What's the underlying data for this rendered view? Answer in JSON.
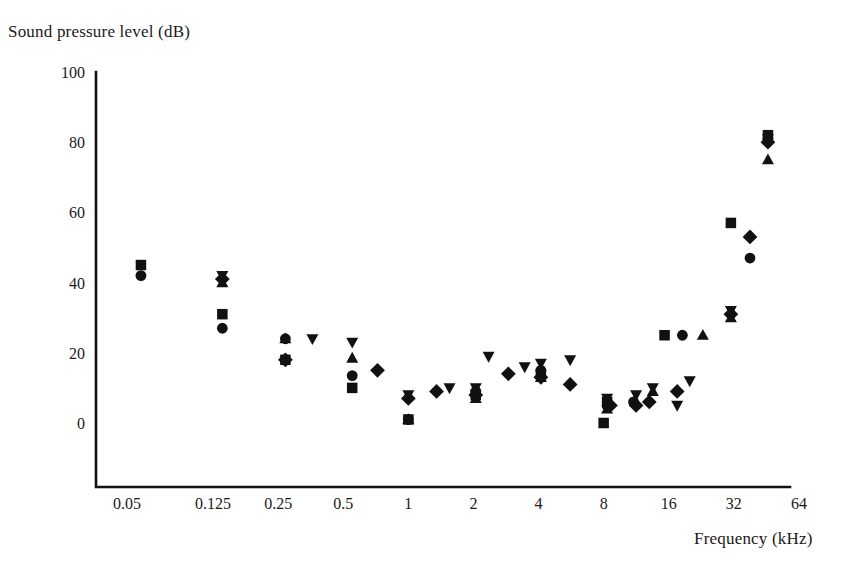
{
  "figure": {
    "width": 858,
    "height": 581,
    "background": "#ffffff",
    "ink_color": "#111111"
  },
  "axis_titles": {
    "y": "Sound pressure level (dB)",
    "x": "Frequency (kHz)"
  },
  "chart_data": {
    "type": "scatter",
    "title": "",
    "subtitle": "",
    "xlabel": "Frequency (kHz)",
    "ylabel": "Sound pressure level (dB)",
    "xscale": "log2",
    "yscale": "linear",
    "xlim": [
      0.0405,
      80
    ],
    "ylim": [
      -8,
      100
    ],
    "ylim_axis": [
      0,
      100
    ],
    "grid": false,
    "legend": "none",
    "legend_entries": [],
    "annotations": [],
    "xticks": [
      0.05,
      0.125,
      0.25,
      0.5,
      1,
      2,
      4,
      8,
      16,
      32,
      64
    ],
    "xtick_labels": [
      "0.05",
      "0.125",
      "0.25",
      "0.5",
      "1",
      "2",
      "4",
      "8",
      "16",
      "32",
      "64"
    ],
    "yticks": [
      0,
      20,
      40,
      60,
      80,
      100
    ],
    "ytick_labels": [
      "0",
      "20",
      "40",
      "60",
      "80",
      "100"
    ],
    "marker_shapes": [
      "square",
      "circle",
      "diamond",
      "triangle-up",
      "triangle-down"
    ],
    "series": [
      {
        "name": "series-square",
        "marker": "square",
        "points": [
          {
            "x": 0.058,
            "y": 45
          },
          {
            "x": 0.138,
            "y": 31
          },
          {
            "x": 0.27,
            "y": 18
          },
          {
            "x": 0.55,
            "y": 10
          },
          {
            "x": 1.0,
            "y": 1
          },
          {
            "x": 2.05,
            "y": 8
          },
          {
            "x": 4.1,
            "y": 14
          },
          {
            "x": 8.0,
            "y": 0
          },
          {
            "x": 8.3,
            "y": 6
          },
          {
            "x": 15.3,
            "y": 25
          },
          {
            "x": 31.0,
            "y": 57
          },
          {
            "x": 46.0,
            "y": 82
          }
        ]
      },
      {
        "name": "series-circle",
        "marker": "circle",
        "points": [
          {
            "x": 0.058,
            "y": 42
          },
          {
            "x": 0.138,
            "y": 27
          },
          {
            "x": 0.27,
            "y": 24
          },
          {
            "x": 0.55,
            "y": 13.5
          },
          {
            "x": 1.0,
            "y": 1
          },
          {
            "x": 2.05,
            "y": 9
          },
          {
            "x": 4.1,
            "y": 15
          },
          {
            "x": 8.3,
            "y": 5
          },
          {
            "x": 11.0,
            "y": 6
          },
          {
            "x": 18.5,
            "y": 25
          },
          {
            "x": 38.0,
            "y": 47
          },
          {
            "x": 46.0,
            "y": 81
          }
        ]
      },
      {
        "name": "series-diamond",
        "marker": "diamond",
        "points": [
          {
            "x": 0.138,
            "y": 41
          },
          {
            "x": 0.27,
            "y": 18
          },
          {
            "x": 0.72,
            "y": 15
          },
          {
            "x": 1.0,
            "y": 7
          },
          {
            "x": 1.35,
            "y": 9
          },
          {
            "x": 2.05,
            "y": 8
          },
          {
            "x": 2.9,
            "y": 14
          },
          {
            "x": 4.1,
            "y": 13
          },
          {
            "x": 5.6,
            "y": 11
          },
          {
            "x": 8.6,
            "y": 5
          },
          {
            "x": 11.3,
            "y": 5
          },
          {
            "x": 13.0,
            "y": 6
          },
          {
            "x": 17.5,
            "y": 9
          },
          {
            "x": 31.0,
            "y": 31
          },
          {
            "x": 38.0,
            "y": 53
          },
          {
            "x": 46.0,
            "y": 80
          }
        ]
      },
      {
        "name": "series-triangle-up",
        "marker": "triangle-up",
        "points": [
          {
            "x": 0.138,
            "y": 40
          },
          {
            "x": 0.27,
            "y": 24
          },
          {
            "x": 0.55,
            "y": 18.5
          },
          {
            "x": 1.0,
            "y": 1
          },
          {
            "x": 2.05,
            "y": 7
          },
          {
            "x": 4.1,
            "y": 13
          },
          {
            "x": 8.3,
            "y": 4
          },
          {
            "x": 13.5,
            "y": 9
          },
          {
            "x": 23.0,
            "y": 25
          },
          {
            "x": 31.0,
            "y": 30
          },
          {
            "x": 46.0,
            "y": 75
          }
        ]
      },
      {
        "name": "series-triangle-down",
        "marker": "triangle-down",
        "points": [
          {
            "x": 0.138,
            "y": 42
          },
          {
            "x": 0.36,
            "y": 24
          },
          {
            "x": 0.55,
            "y": 23
          },
          {
            "x": 1.0,
            "y": 8
          },
          {
            "x": 1.55,
            "y": 10
          },
          {
            "x": 2.05,
            "y": 10
          },
          {
            "x": 2.35,
            "y": 19
          },
          {
            "x": 3.45,
            "y": 16
          },
          {
            "x": 4.1,
            "y": 17
          },
          {
            "x": 5.6,
            "y": 18
          },
          {
            "x": 8.3,
            "y": 7
          },
          {
            "x": 11.3,
            "y": 8
          },
          {
            "x": 13.5,
            "y": 10
          },
          {
            "x": 17.5,
            "y": 5
          },
          {
            "x": 20.0,
            "y": 12
          },
          {
            "x": 31.0,
            "y": 32
          },
          {
            "x": 46.0,
            "y": 81
          }
        ]
      }
    ]
  }
}
